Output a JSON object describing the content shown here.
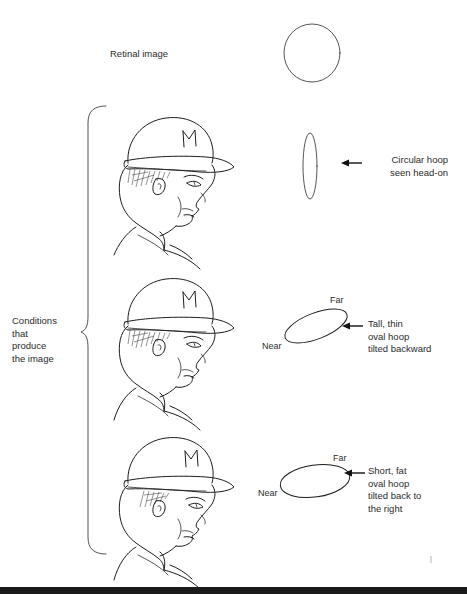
{
  "figure": {
    "title_label": "Retinal image",
    "bracket_label": "Conditions\nthat\nproduce\nthe image"
  },
  "rows": [
    {
      "id": "row-head-on",
      "shape": "tall-narrow-ellipse",
      "caption": "Circular hoop\nseen head-on",
      "caption_align": "right",
      "near_label": "",
      "far_label": "",
      "arrow_icon": "left-arrow-icon"
    },
    {
      "id": "row-tilted-backward",
      "shape": "tilted-thin-ellipse",
      "caption": "Tall, thin\noval hoop\ntilted backward",
      "caption_align": "left",
      "near_label": "Near",
      "far_label": "Far",
      "arrow_icon": "left-arrow-icon"
    },
    {
      "id": "row-tilted-right",
      "shape": "flat-wide-ellipse",
      "caption": "Short, fat\noval hoop\ntilted back to\nthe right",
      "caption_align": "left",
      "near_label": "Near",
      "far_label": "Far",
      "arrow_icon": "left-arrow-icon"
    }
  ],
  "retinal_shape": {
    "id": "retinal-circle",
    "shape": "circle"
  },
  "people": [
    {
      "id": "person-profile-1",
      "cap_logo": "M"
    },
    {
      "id": "person-profile-2",
      "cap_logo": "M"
    },
    {
      "id": "person-profile-3",
      "cap_logo": "M"
    }
  ],
  "colors": {
    "ink": "#1d1d1d",
    "text": "#2b2b2b",
    "bar": "#1a1a1a",
    "page": "#ffffff"
  }
}
